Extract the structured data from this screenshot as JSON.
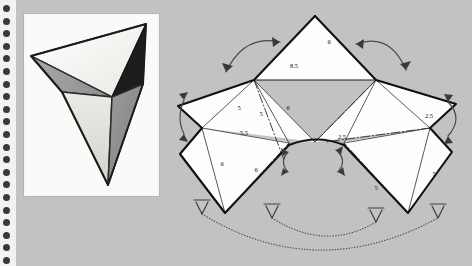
{
  "page": {
    "background_color": "#c2c2c2"
  },
  "binding": {
    "name": "spiral-binding-strip",
    "strip_color": "#f2f2f2",
    "hole_color": "#3a3a3a",
    "hole_count": 21,
    "hole_spacing": 12.6,
    "hole_first_y": 5
  },
  "photo": {
    "name": "solid-photograph",
    "frame_color": "#f7f7f7",
    "caption": "",
    "faces": [
      {
        "name": "top-light-face",
        "fill": "#f4f2ee"
      },
      {
        "name": "left-mid-gray-face",
        "fill": "#9c9c9c"
      },
      {
        "name": "right-dark-face",
        "fill": "#1d1d1d"
      },
      {
        "name": "lower-left-pale-face",
        "fill": "#dedcd7"
      },
      {
        "name": "lower-right-gray-face",
        "fill": "#8f8f8f"
      }
    ]
  },
  "diagram": {
    "name": "unfolding-net-diagram",
    "face_fill": "#fdfdfd",
    "outline_color": "#111111",
    "crease_color": "#333333",
    "arrow_color": "#4a4a4a",
    "labels": [
      {
        "id": "top-right-edge",
        "text": "6",
        "x": 153,
        "y": 44
      },
      {
        "id": "top-base-edge",
        "text": "8.5",
        "x": 118,
        "y": 68
      },
      {
        "id": "upper-left-face",
        "text": "5",
        "x": 63,
        "y": 110
      },
      {
        "id": "upper-left-crease",
        "text": "5",
        "x": 85,
        "y": 116
      },
      {
        "id": "middle-crease",
        "text": "6",
        "x": 112,
        "y": 110
      },
      {
        "id": "left-lower-edge",
        "text": "5.5",
        "x": 68,
        "y": 135
      },
      {
        "id": "left-face-edge",
        "text": "6",
        "x": 46,
        "y": 166
      },
      {
        "id": "left-inner-crease",
        "text": "6",
        "x": 80,
        "y": 172
      },
      {
        "id": "right-upper-edge",
        "text": "2.5",
        "x": 253,
        "y": 118
      },
      {
        "id": "center-bottom-edge",
        "text": "2.5",
        "x": 166,
        "y": 139
      },
      {
        "id": "right-lower-face",
        "text": "5",
        "x": 200,
        "y": 190
      },
      {
        "id": "right-outer-face",
        "text": "5",
        "x": 258,
        "y": 176
      }
    ],
    "fold_arrows": [
      {
        "id": "top-left-fold-arrow",
        "style": "double-headed-solid"
      },
      {
        "id": "top-right-fold-arrow",
        "style": "single-headed-solid"
      },
      {
        "id": "left-edge-fold-arrow",
        "style": "double-headed-solid"
      },
      {
        "id": "right-edge-fold-arrow",
        "style": "double-headed-solid"
      },
      {
        "id": "center-left-fold-arrow",
        "style": "double-headed-solid"
      },
      {
        "id": "center-right-fold-arrow",
        "style": "double-headed-solid"
      },
      {
        "id": "bottom-inner-dotted-arrow",
        "style": "dotted-curve"
      },
      {
        "id": "bottom-outer-dotted-arrow",
        "style": "dotted-curve"
      }
    ]
  }
}
